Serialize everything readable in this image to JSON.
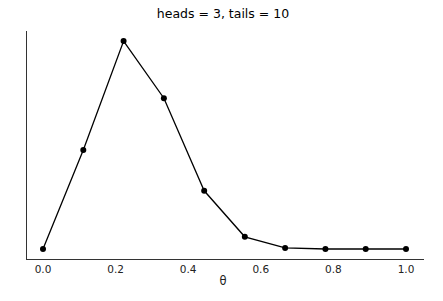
{
  "chart_data": {
    "type": "line",
    "title": "heads = 3, tails = 10",
    "xlabel": "θ",
    "ylabel": "",
    "x": [
      0.0,
      0.111,
      0.222,
      0.333,
      0.444,
      0.556,
      0.667,
      0.778,
      0.889,
      1.0
    ],
    "series": [
      {
        "name": "posterior",
        "values": [
          0.0,
          0.187,
          0.393,
          0.285,
          0.11,
          0.023,
          0.002,
          0.0,
          0.0,
          0.0
        ],
        "color": "#000000",
        "marker": "circle"
      }
    ],
    "xticks": [
      0.0,
      0.2,
      0.4,
      0.6,
      0.8,
      1.0
    ],
    "xtick_labels": [
      "0.0",
      "0.2",
      "0.4",
      "0.6",
      "0.8",
      "1.0"
    ],
    "yticks": [],
    "xlim": [
      -0.045,
      1.05
    ],
    "ylim": [
      -0.004,
      0.398
    ],
    "grid": false,
    "legend": null,
    "spines": [
      "left",
      "bottom"
    ]
  }
}
